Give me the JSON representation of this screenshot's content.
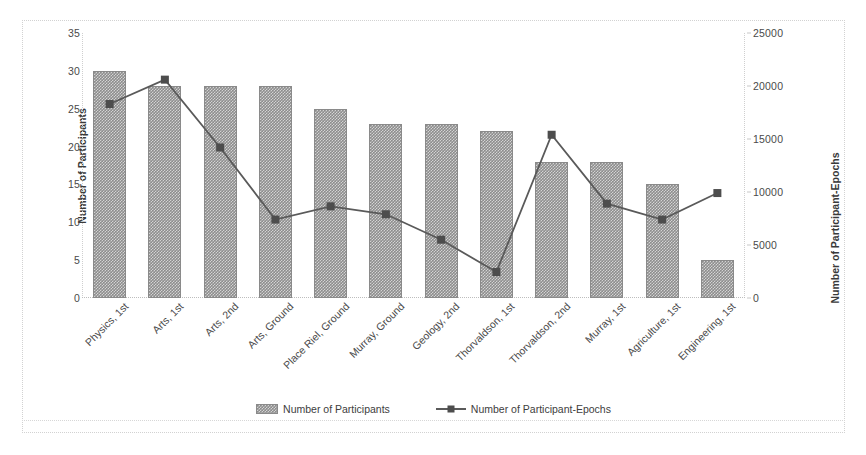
{
  "chart_data": {
    "type": "bar",
    "title": "",
    "xlabel": "",
    "ylabel": "Number of Participants",
    "y2label": "Number of Participant-Epochs",
    "grid": false,
    "legend_position": "bottom",
    "categories": [
      "Physics, 1st",
      "Arts, 1st",
      "Arts, 2nd",
      "Arts, Ground",
      "Place Riel, Ground",
      "Murray, Ground",
      "Geology, 2nd",
      "Thorvaldson, 1st",
      "Thorvaldson, 2nd",
      "Murray, 1st",
      "Agriculture, 1st",
      "Engineering, 1st"
    ],
    "series": [
      {
        "name": "Number of Participants",
        "type": "bar",
        "axis": "left",
        "values": [
          30,
          28,
          28,
          28,
          25,
          23,
          23,
          22,
          18,
          18,
          15,
          5
        ]
      },
      {
        "name": "Number of Participant-Epochs",
        "type": "line",
        "axis": "right",
        "values": [
          18300,
          20600,
          14200,
          7400,
          8650,
          7900,
          5500,
          2450,
          15400,
          8900,
          7400,
          9900
        ]
      }
    ],
    "ylim": [
      0,
      35
    ],
    "yticks": [
      0,
      5,
      10,
      15,
      20,
      25,
      30,
      35
    ],
    "ylim2": [
      0,
      25000
    ],
    "yticks2": [
      0,
      5000,
      10000,
      15000,
      20000,
      25000
    ],
    "colors": {
      "bar_fill": "#8d8d8d",
      "bar_edge": "#8a8a8a",
      "line": "#5a5a5a",
      "marker": "#4d4d4d",
      "axis_text": "#4a4a4a",
      "frame": "#cfcfcf"
    }
  },
  "legend": {
    "items": [
      {
        "label": "Number of Participants",
        "marker": "bar-swatch"
      },
      {
        "label": "Number of Participant-Epochs",
        "marker": "line-marker-swatch"
      }
    ]
  }
}
